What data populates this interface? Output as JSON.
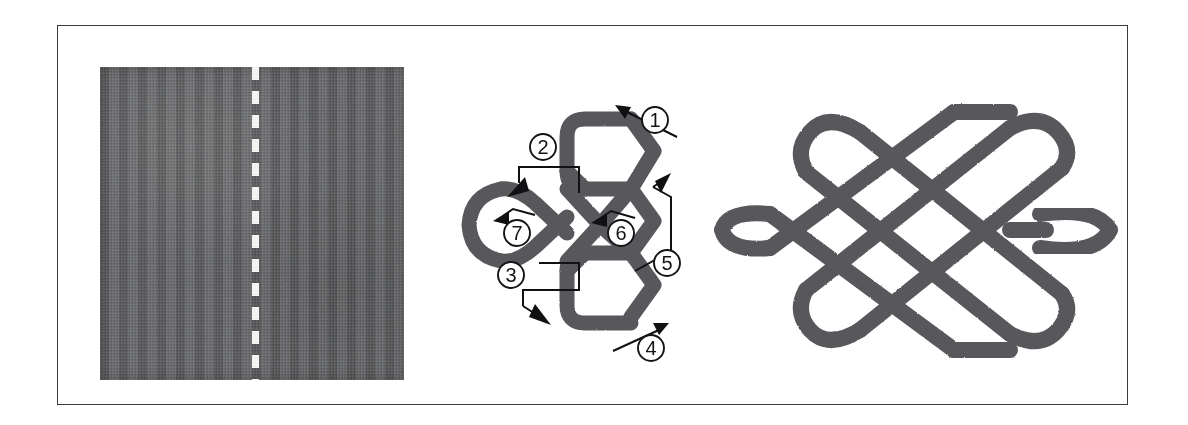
{
  "figure": {
    "border_color": "#3a3a3c",
    "background": "#ffffff"
  },
  "panels": [
    {
      "id": "fabric-panel",
      "name": "folded-fabric-swatch",
      "description": "Dark gray woven fabric square with a white dashed fold line down the centre",
      "fabric_color": "#595a5c",
      "fold_line_color": "#f3f3f1",
      "fold_line_style": "dashed-vertical"
    },
    {
      "id": "steps-panel",
      "name": "knot-weaving-steps",
      "description": "Partially formed knot with seven numbered directional arrows showing the weaving order",
      "cord_color": "#58595b",
      "arrow_color": "#111113"
    },
    {
      "id": "finished-panel",
      "name": "finished-endless-knot",
      "description": "Completed symmetrical endless knot with six loops",
      "cord_color": "#58595b"
    }
  ],
  "step_markers": [
    {
      "label": "1",
      "cx": 200,
      "cy": 35,
      "direction": "up-left",
      "leader": "straight"
    },
    {
      "label": "2",
      "cx": 88,
      "cy": 80,
      "direction": "up-left",
      "leader": "stepped"
    },
    {
      "label": "3",
      "cx": 68,
      "cy": 190,
      "direction": "down-right",
      "leader": "stepped"
    },
    {
      "label": "4",
      "cx": 196,
      "cy": 255,
      "direction": "up-right",
      "leader": "straight"
    },
    {
      "label": "5",
      "cx": 208,
      "cy": 165,
      "direction": "up-right",
      "leader": "zigzag"
    },
    {
      "label": "6",
      "cx": 162,
      "cy": 142,
      "direction": "left",
      "leader": "hook"
    },
    {
      "label": "7",
      "cx": 62,
      "cy": 143,
      "direction": "up-left",
      "leader": "hook"
    }
  ]
}
